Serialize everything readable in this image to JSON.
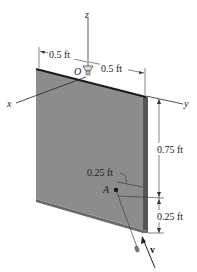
{
  "axes": {
    "x_label": "x",
    "y_label": "y",
    "z_label": "z"
  },
  "points": {
    "origin_label": "O",
    "point_label": "A"
  },
  "dimensions": {
    "top_left": "0.5 ft",
    "top_right": "0.5 ft",
    "right_upper": "0.75 ft",
    "right_lower": "0.25 ft",
    "point_offset": "0.25 ft"
  },
  "vector": {
    "label": "v"
  },
  "colors": {
    "plate_face": "#8c8c8c",
    "plate_edge": "#555555",
    "plate_top": "#1a1a1a",
    "line": "#333333"
  }
}
